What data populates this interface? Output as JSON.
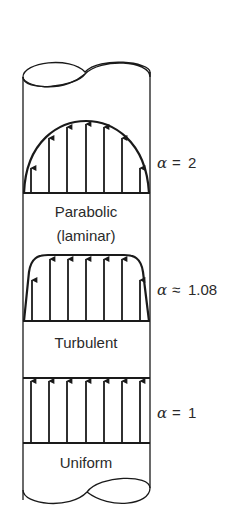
{
  "figure": {
    "colors": {
      "stroke": "#1a1a1a",
      "text": "#2a2a2a",
      "background": "#ffffff"
    },
    "profiles": [
      {
        "name": "Parabolic",
        "sub_label": "(laminar)",
        "alpha_symbol": "α",
        "alpha_relation": "=",
        "alpha_value": "2"
      },
      {
        "name": "Turbulent",
        "sub_label": "",
        "alpha_symbol": "α",
        "alpha_relation": "≈",
        "alpha_value": "1.08"
      },
      {
        "name": "Uniform",
        "sub_label": "",
        "alpha_symbol": "α",
        "alpha_relation": "=",
        "alpha_value": "1"
      }
    ]
  }
}
